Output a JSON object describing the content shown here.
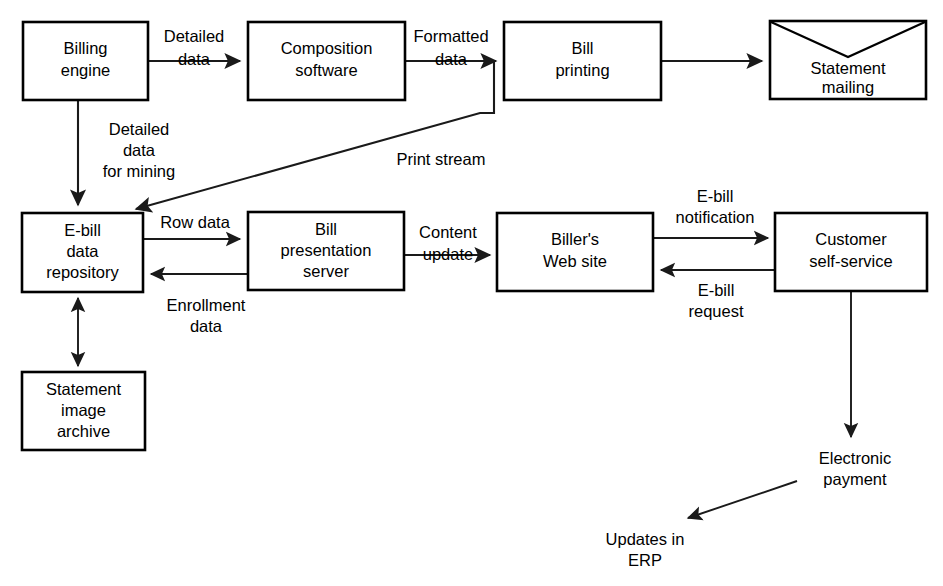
{
  "diagram": {
    "background_color": "#ffffff",
    "line_color": "#1a1a1a",
    "text_color": "#000000",
    "nodes": [
      {
        "id": "billing_engine",
        "shape": "rect",
        "lines": [
          "Billing",
          "engine"
        ]
      },
      {
        "id": "composition",
        "shape": "rect",
        "lines": [
          "Composition",
          "software"
        ]
      },
      {
        "id": "bill_printing",
        "shape": "rect",
        "lines": [
          "Bill",
          "printing"
        ]
      },
      {
        "id": "statement_mailing",
        "shape": "envelope",
        "lines": [
          "Statement",
          "mailing"
        ]
      },
      {
        "id": "ebill_repository",
        "shape": "rect",
        "lines": [
          "E-bill",
          "data",
          "repository"
        ]
      },
      {
        "id": "bill_presentation",
        "shape": "rect",
        "lines": [
          "Bill",
          "presentation",
          "server"
        ]
      },
      {
        "id": "billers_web_site",
        "shape": "rect",
        "lines": [
          "Biller's",
          "Web site"
        ]
      },
      {
        "id": "customer_self",
        "shape": "rect",
        "lines": [
          "Customer",
          "self-service"
        ]
      },
      {
        "id": "statement_archive",
        "shape": "rect",
        "lines": [
          "Statement",
          "image",
          "archive"
        ]
      }
    ],
    "edges": [
      {
        "id": "e1",
        "from": "billing_engine",
        "to": "composition",
        "lines": [
          "Detailed",
          "data"
        ]
      },
      {
        "id": "e2",
        "from": "composition",
        "to": "bill_printing",
        "lines": [
          "Formatted",
          "data"
        ]
      },
      {
        "id": "e3",
        "from": "bill_printing",
        "to": "statement_mailing",
        "lines": []
      },
      {
        "id": "e4",
        "from": "billing_engine",
        "to": "ebill_repository",
        "lines": [
          "Detailed",
          "data",
          "for mining"
        ]
      },
      {
        "id": "e5",
        "from": "bill_printing",
        "to": "ebill_repository",
        "lines": [
          "Print stream"
        ]
      },
      {
        "id": "e6",
        "from": "ebill_repository",
        "to": "bill_presentation",
        "lines": [
          "Row data"
        ]
      },
      {
        "id": "e7",
        "from": "bill_presentation",
        "to": "ebill_repository",
        "lines": [
          "Enrollment",
          "data"
        ]
      },
      {
        "id": "e8",
        "from": "bill_presentation",
        "to": "billers_web_site",
        "lines": [
          "Content",
          "update"
        ]
      },
      {
        "id": "e9",
        "from": "billers_web_site",
        "to": "customer_self",
        "lines": [
          "E-bill",
          "notification"
        ]
      },
      {
        "id": "e10",
        "from": "customer_self",
        "to": "billers_web_site",
        "lines": [
          "E-bill",
          "request"
        ]
      },
      {
        "id": "e11",
        "from": "ebill_repository",
        "to": "statement_archive",
        "lines": []
      },
      {
        "id": "e12",
        "from": "customer_self",
        "to": "electronic_payment",
        "lines": [
          "Electronic",
          "payment"
        ]
      },
      {
        "id": "e13",
        "from": "electronic_payment",
        "to": "updates_erp",
        "lines": [
          "Updates in",
          "ERP"
        ]
      }
    ],
    "free_labels": [
      {
        "id": "electronic_payment",
        "lines": [
          "Electronic",
          "payment"
        ]
      },
      {
        "id": "updates_erp",
        "lines": [
          "Updates in",
          "ERP"
        ]
      }
    ],
    "text": {
      "billing_engine_l1": "Billing",
      "billing_engine_l2": "engine",
      "composition_l1": "Composition",
      "composition_l2": "software",
      "bill_printing_l1": "Bill",
      "bill_printing_l2": "printing",
      "statement_mailing_l1": "Statement",
      "statement_mailing_l2": "mailing",
      "ebill_repository_l1": "E-bill",
      "ebill_repository_l2": "data",
      "ebill_repository_l3": "repository",
      "bill_presentation_l1": "Bill",
      "bill_presentation_l2": "presentation",
      "bill_presentation_l3": "server",
      "billers_web_site_l1": "Biller's",
      "billers_web_site_l2": "Web site",
      "customer_self_l1": "Customer",
      "customer_self_l2": "self-service",
      "statement_archive_l1": "Statement",
      "statement_archive_l2": "image",
      "statement_archive_l3": "archive",
      "detailed_data_l1": "Detailed",
      "detailed_data_l2": "data",
      "formatted_data_l1": "Formatted",
      "formatted_data_l2": "data",
      "detailed_mining_l1": "Detailed",
      "detailed_mining_l2": "data",
      "detailed_mining_l3": "for mining",
      "print_stream": "Print stream",
      "row_data": "Row data",
      "enrollment_data_l1": "Enrollment",
      "enrollment_data_l2": "data",
      "content_update_l1": "Content",
      "content_update_l2": "update",
      "ebill_notification_l1": "E-bill",
      "ebill_notification_l2": "notification",
      "ebill_request_l1": "E-bill",
      "ebill_request_l2": "request",
      "electronic_payment_l1": "Electronic",
      "electronic_payment_l2": "payment",
      "updates_erp_l1": "Updates in",
      "updates_erp_l2": "ERP"
    }
  }
}
